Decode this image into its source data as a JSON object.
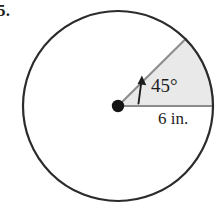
{
  "figure": {
    "exercise_number": "5.",
    "angle_label": "45°",
    "radius_label": "6 in.",
    "shape": "circle-with-shaded-sector",
    "colors": {
      "circle_outline": "#2b2b2b",
      "sector_fill": "#e9e9e9",
      "sector_edge": "#8c8c8c",
      "center_dot": "#141414",
      "arrow": "#1d1d1d",
      "background": "#ffffff",
      "text": "#1d1d1d"
    },
    "geometry": {
      "center_x": 118,
      "center_y": 106,
      "radius": 95,
      "sector_start_angle_deg": 0,
      "sector_end_angle_deg": 45,
      "center_dot_radius": 6
    }
  }
}
